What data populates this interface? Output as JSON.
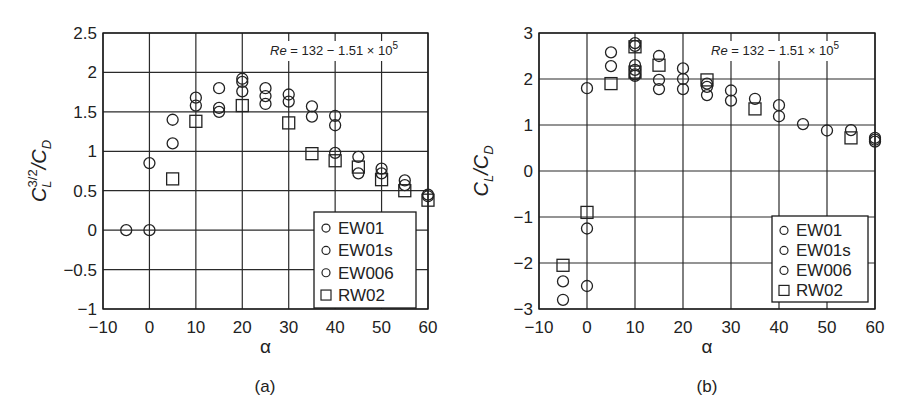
{
  "chart_data": [
    {
      "id": "a",
      "type": "scatter",
      "caption": "(a)",
      "xlabel": "α",
      "ylabel": "C_L^{3/2}/C_D",
      "ylabel_parts": {
        "main": "C",
        "sub": "L",
        "sup": "3/2",
        "rest": "/C",
        "sub2": "D"
      },
      "xlim": [
        -10,
        60
      ],
      "ylim": [
        -1,
        2.5
      ],
      "xticks": [
        -10,
        0,
        10,
        20,
        30,
        40,
        50,
        60
      ],
      "xtick_labels": [
        "−10",
        "0",
        "10",
        "20",
        "30",
        "40",
        "50",
        "60"
      ],
      "yticks": [
        2.5,
        2,
        1.5,
        1,
        0.5,
        0,
        -0.5,
        -1
      ],
      "ytick_labels": [
        "2.5",
        "2",
        "1.5",
        "1",
        "0.5",
        "0",
        "−0.5",
        "−1"
      ],
      "grid": true,
      "annotation": {
        "re": "Re",
        "text": "= 132 − 1.51 × 10",
        "sup": "5"
      },
      "legend": {
        "position": "lower right",
        "entries": [
          {
            "label": "EW01",
            "marker": "circle"
          },
          {
            "label": "EW01s",
            "marker": "circle"
          },
          {
            "label": "EW006",
            "marker": "circle"
          },
          {
            "label": "RW02",
            "marker": "square"
          }
        ]
      },
      "series": [
        {
          "name": "EW01/EW01s/EW006",
          "marker": "circle",
          "points": [
            [
              -5,
              0
            ],
            [
              0,
              0.85
            ],
            [
              0,
              0
            ],
            [
              5,
              1.4
            ],
            [
              5,
              1.1
            ],
            [
              10,
              1.68
            ],
            [
              10,
              1.58
            ],
            [
              15,
              1.8
            ],
            [
              15,
              1.55
            ],
            [
              15,
              1.5
            ],
            [
              20,
              1.92
            ],
            [
              20,
              1.88
            ],
            [
              20,
              1.76
            ],
            [
              25,
              1.8
            ],
            [
              25,
              1.7
            ],
            [
              25,
              1.6
            ],
            [
              30,
              1.72
            ],
            [
              30,
              1.63
            ],
            [
              35,
              1.57
            ],
            [
              35,
              1.44
            ],
            [
              40,
              1.45
            ],
            [
              40,
              1.33
            ],
            [
              40,
              0.98
            ],
            [
              45,
              0.93
            ],
            [
              45,
              0.72
            ],
            [
              50,
              0.78
            ],
            [
              50,
              0.72
            ],
            [
              55,
              0.63
            ],
            [
              55,
              0.57
            ],
            [
              60,
              0.45
            ],
            [
              60,
              0.43
            ]
          ]
        },
        {
          "name": "RW02",
          "marker": "square",
          "points": [
            [
              5,
              0.65
            ],
            [
              10,
              1.38
            ],
            [
              20,
              1.58
            ],
            [
              30,
              1.36
            ],
            [
              35,
              0.97
            ],
            [
              40,
              0.88
            ],
            [
              45,
              0.8
            ],
            [
              50,
              0.64
            ],
            [
              55,
              0.5
            ],
            [
              60,
              0.38
            ]
          ]
        }
      ]
    },
    {
      "id": "b",
      "type": "scatter",
      "caption": "(b)",
      "xlabel": "α",
      "ylabel": "C_L/C_D",
      "ylabel_parts": {
        "main": "C",
        "sub": "L",
        "sup": "",
        "rest": "/C",
        "sub2": "D"
      },
      "xlim": [
        -10,
        60
      ],
      "ylim": [
        -3,
        3
      ],
      "xticks": [
        -10,
        0,
        10,
        20,
        30,
        40,
        50,
        60
      ],
      "xtick_labels": [
        "−10",
        "0",
        "10",
        "20",
        "30",
        "40",
        "50",
        "60"
      ],
      "yticks": [
        3,
        2,
        1,
        0,
        -1,
        -2,
        -3
      ],
      "ytick_labels": [
        "3",
        "2",
        "1",
        "0",
        "−1",
        "−2",
        "−3"
      ],
      "grid": true,
      "annotation": {
        "re": "Re",
        "text": "= 132 − 1.51 × 10",
        "sup": "5"
      },
      "legend": {
        "position": "lower right",
        "entries": [
          {
            "label": "EW01",
            "marker": "circle"
          },
          {
            "label": "EW01s",
            "marker": "circle"
          },
          {
            "label": "EW006",
            "marker": "circle"
          },
          {
            "label": "RW02",
            "marker": "square"
          }
        ]
      },
      "series": [
        {
          "name": "EW01/EW01s/EW006",
          "marker": "circle",
          "points": [
            [
              -5,
              -2.4
            ],
            [
              -5,
              -2.8
            ],
            [
              0,
              1.8
            ],
            [
              0,
              -1.25
            ],
            [
              0,
              -2.5
            ],
            [
              5,
              2.58
            ],
            [
              5,
              2.28
            ],
            [
              10,
              2.78
            ],
            [
              10,
              2.72
            ],
            [
              10,
              2.3
            ],
            [
              10,
              2.2
            ],
            [
              10,
              2.1
            ],
            [
              10,
              2.07
            ],
            [
              15,
              2.5
            ],
            [
              15,
              1.98
            ],
            [
              15,
              1.78
            ],
            [
              20,
              2.23
            ],
            [
              20,
              2.0
            ],
            [
              20,
              1.78
            ],
            [
              25,
              1.9
            ],
            [
              25,
              1.83
            ],
            [
              25,
              1.65
            ],
            [
              30,
              1.75
            ],
            [
              30,
              1.53
            ],
            [
              35,
              1.57
            ],
            [
              40,
              1.43
            ],
            [
              40,
              1.19
            ],
            [
              45,
              1.02
            ],
            [
              50,
              0.88
            ],
            [
              55,
              0.89
            ],
            [
              60,
              0.72
            ],
            [
              60,
              0.68
            ],
            [
              60,
              0.64
            ]
          ]
        },
        {
          "name": "RW02",
          "marker": "square",
          "points": [
            [
              -5,
              -2.05
            ],
            [
              0,
              -0.9
            ],
            [
              5,
              1.9
            ],
            [
              10,
              2.7
            ],
            [
              10,
              2.15
            ],
            [
              15,
              2.3
            ],
            [
              25,
              1.98
            ],
            [
              35,
              1.35
            ],
            [
              55,
              0.72
            ]
          ]
        }
      ]
    }
  ]
}
